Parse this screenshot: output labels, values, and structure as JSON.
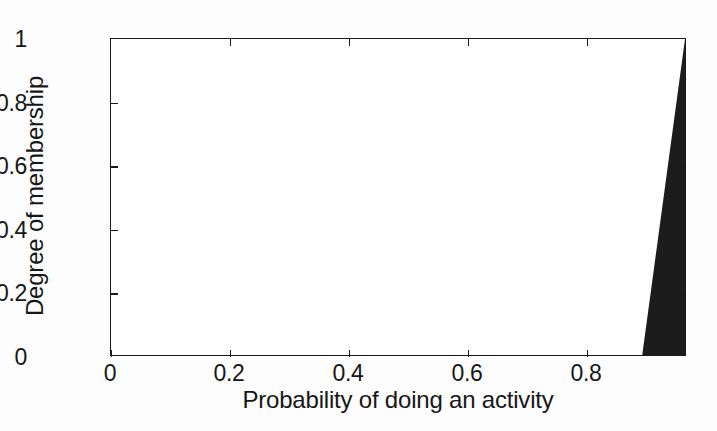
{
  "chart_data": {
    "type": "area",
    "title": "",
    "subtitle": "",
    "xlabel": "Probability of doing an activity",
    "ylabel": "Degree of membership",
    "xlim": [
      0,
      0.967
    ],
    "ylim": [
      0,
      1
    ],
    "xticks": [
      0,
      0.2,
      0.4,
      0.6,
      0.8
    ],
    "yticks": [
      0,
      0.2,
      0.4,
      0.6,
      0.8,
      1
    ],
    "xticklabels": [
      "0",
      "0.2",
      "0.4",
      "0.6",
      "0.8"
    ],
    "yticklabels": [
      "0",
      "0.2",
      "0.4",
      "0.6",
      "0.8",
      "1"
    ],
    "grid": false,
    "legend": null,
    "annotations": [],
    "series": [
      {
        "name": "membership function",
        "fill_color": "#1c1c1c",
        "x": [
          0,
          0.895,
          0.967,
          0.967
        ],
        "y": [
          0,
          0,
          1,
          0
        ]
      }
    ]
  },
  "axes": {
    "x_tick_labels": [
      {
        "value": 0,
        "label": "0"
      },
      {
        "value": 0.2,
        "label": "0.2"
      },
      {
        "value": 0.4,
        "label": "0.4"
      },
      {
        "value": 0.6,
        "label": "0.6"
      },
      {
        "value": 0.8,
        "label": "0.8"
      }
    ],
    "y_tick_labels": [
      {
        "value": 0,
        "label": "0"
      },
      {
        "value": 0.2,
        "label": "0.2"
      },
      {
        "value": 0.4,
        "label": "0.4"
      },
      {
        "value": 0.6,
        "label": "0.6"
      },
      {
        "value": 0.8,
        "label": "0.8"
      },
      {
        "value": 1,
        "label": "1"
      }
    ]
  },
  "colors": {
    "fill": "#1c1c1c",
    "axis": "#1a1a1a",
    "text": "#171717",
    "plot_background": "#ffffff",
    "figure_background": "#fdfdfd"
  }
}
